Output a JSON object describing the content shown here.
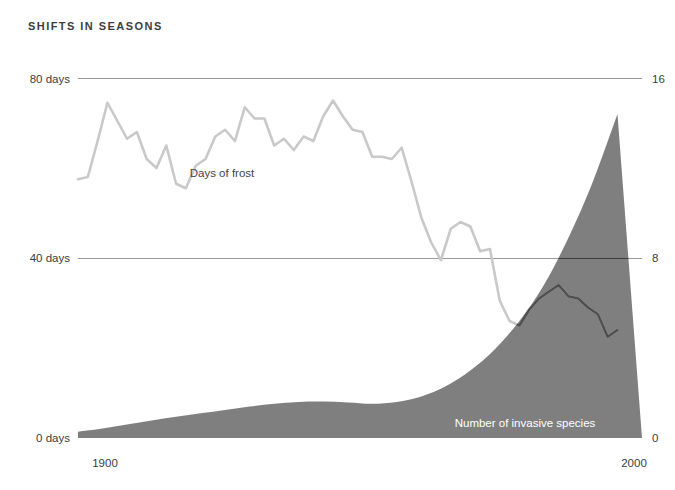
{
  "chart_data": {
    "type": "line",
    "title": "SHIFTS IN SEASONS",
    "xlabel": "",
    "ylabel": "",
    "grid": true,
    "legend_position": "inline-annotations",
    "x_ticks": [
      "1900",
      "2000"
    ],
    "x_tick_values": [
      1900,
      2000
    ],
    "xlim": [
      1890,
      2005
    ],
    "left_axis": {
      "label": "Days of frost",
      "ticks": [
        "0 days",
        "40 days",
        "80 days"
      ],
      "tick_values": [
        0,
        40,
        80
      ],
      "ylim": [
        0,
        80
      ],
      "color": "#c9c9c9"
    },
    "right_axis": {
      "label": "Number of invasive species",
      "ticks": [
        "0",
        "8",
        "16"
      ],
      "tick_values": [
        0,
        8,
        16
      ],
      "ylim": [
        0,
        16
      ],
      "color": "#7f7f7f"
    },
    "series": [
      {
        "name": "Days of frost",
        "type": "line",
        "axis": "left",
        "color": "#c9c9c9",
        "color_overlap": "#4f4f4f",
        "x": [
          1890,
          1892,
          1894,
          1896,
          1898,
          1900,
          1902,
          1904,
          1906,
          1908,
          1910,
          1912,
          1914,
          1916,
          1918,
          1920,
          1922,
          1924,
          1926,
          1928,
          1930,
          1932,
          1934,
          1936,
          1938,
          1940,
          1942,
          1944,
          1946,
          1948,
          1950,
          1952,
          1954,
          1956,
          1958,
          1960,
          1962,
          1964,
          1966,
          1968,
          1970,
          1972,
          1974,
          1976,
          1978,
          1980,
          1982,
          1984,
          1986,
          1988,
          1990,
          1992,
          1994,
          1996,
          1998,
          2000
        ],
        "values": [
          57.5,
          58.0,
          66.0,
          74.5,
          70.5,
          66.5,
          68.0,
          62.0,
          60.0,
          65.0,
          56.5,
          55.5,
          60.5,
          62.0,
          67.0,
          68.5,
          66.0,
          73.5,
          71.0,
          71.0,
          65.0,
          66.5,
          64.0,
          67.0,
          66.0,
          71.5,
          75.0,
          71.5,
          68.5,
          68.0,
          62.5,
          62.5,
          62.0,
          64.5,
          57.0,
          49.0,
          43.5,
          39.5,
          46.5,
          48.0,
          47.0,
          41.5,
          42.0,
          30.5,
          26.0,
          25.0,
          28.5,
          31.0,
          32.5,
          34.0,
          31.5,
          31.0,
          29.0,
          27.5,
          22.5,
          24.0
        ]
      },
      {
        "name": "Number of invasive species",
        "type": "area",
        "axis": "right",
        "color": "#7f7f7f",
        "x": [
          1890,
          1895,
          1900,
          1905,
          1910,
          1915,
          1920,
          1925,
          1930,
          1935,
          1940,
          1945,
          1950,
          1955,
          1960,
          1965,
          1970,
          1975,
          1980,
          1985,
          1990,
          1995,
          2000
        ],
        "values": [
          0.28,
          0.42,
          0.6,
          0.78,
          0.95,
          1.1,
          1.25,
          1.4,
          1.52,
          1.6,
          1.62,
          1.58,
          1.52,
          1.6,
          1.85,
          2.3,
          3.0,
          3.95,
          5.2,
          6.8,
          8.9,
          11.4,
          14.4
        ]
      }
    ],
    "annotations": [
      {
        "text": "Days of frost",
        "x": 1918,
        "y_left_days": 52,
        "style": "dark-on-white"
      },
      {
        "text": "Number of invasive species",
        "x": 1972,
        "y_right_species": 1.5,
        "style": "white-on-fill"
      }
    ],
    "colors": {
      "background": "#ffffff",
      "area_fill": "#7f7f7f",
      "frost_line": "#c9c9c9",
      "frost_line_over_fill": "#4f4f4f",
      "gridline": "#9a9a9a",
      "gridline_over_fill": "#3c3c3c",
      "text": "#3d3d3d",
      "text_on_fill": "#ffffff"
    }
  }
}
